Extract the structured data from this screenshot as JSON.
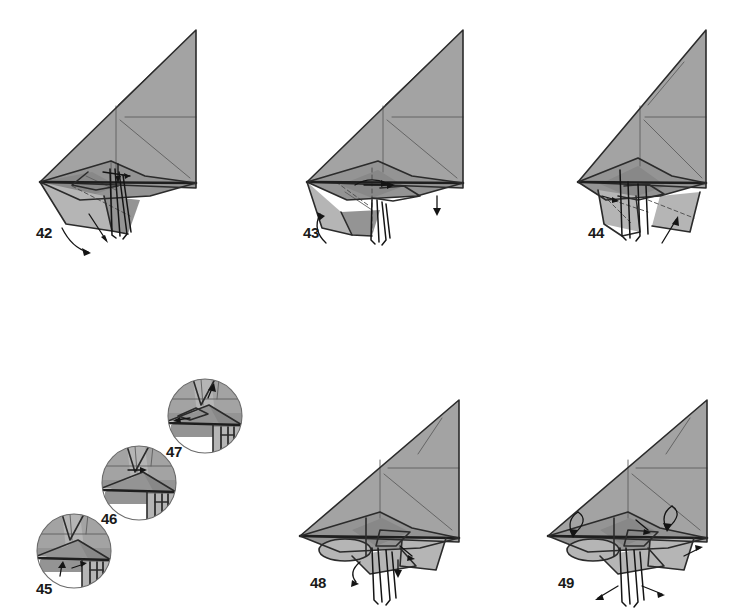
{
  "page": {
    "width": 747,
    "height": 613,
    "background_color": "#ffffff",
    "paper_fill_color": "#a3a3a3",
    "paper_shade_color": "#949494",
    "paper_light_color": "#b5b5b5",
    "line_color": "#2b2b2b",
    "crease_color": "#5e5e5e",
    "label_color": "#1a1a1a"
  },
  "rows": [
    {
      "name": "top-row",
      "steps": [
        "42",
        "43",
        "44"
      ]
    },
    {
      "name": "bottom-row",
      "steps": [
        "45",
        "46",
        "47",
        "48",
        "49"
      ]
    }
  ],
  "steps": [
    {
      "number": "42",
      "kind": "main",
      "label_x": 36,
      "label_y": 238,
      "origin_x": 20,
      "origin_y": 10,
      "scale": 1.0,
      "arrows": [
        "curved-unfold-down-left",
        "straight-fold-down"
      ],
      "notes": "large wing triangle with body and two legs, swing flap down"
    },
    {
      "number": "43",
      "kind": "main",
      "label_x": 303,
      "label_y": 238,
      "origin_x": 287,
      "origin_y": 10,
      "scale": 1.0,
      "arrows": [
        "curved-roll-left",
        "rotate-arrow-center",
        "small-down-arrow-right"
      ],
      "notes": "body narrowed, valley fold dashed line through centre"
    },
    {
      "number": "44",
      "kind": "main",
      "label_x": 588,
      "label_y": 238,
      "origin_x": 572,
      "origin_y": 10,
      "scale": 1.0,
      "arrows": [
        "small-up-arrow-lower-right"
      ],
      "notes": "legs spread, rear flap folded, dashed hidden creases"
    },
    {
      "number": "45",
      "kind": "inset",
      "label_x": 36,
      "label_y": 594,
      "center_x": 74,
      "center_y": 551,
      "radius": 37,
      "arrows": [
        "small-pull-arrow-left",
        "small-point-arrow"
      ],
      "notes": "close-up of body joint, pleat detail"
    },
    {
      "number": "46",
      "kind": "inset",
      "label_x": 101,
      "label_y": 524,
      "center_x": 139,
      "center_y": 483,
      "radius": 37,
      "arrows": [
        "small-point-arrow-right"
      ],
      "notes": "close-up after pleat, narrowing neck"
    },
    {
      "number": "47",
      "kind": "inset",
      "label_x": 166,
      "label_y": 457,
      "center_x": 205,
      "center_y": 416,
      "radius": 37,
      "arrows": [
        "small-arrow-left",
        "small-arrow-up"
      ],
      "notes": "close-up of finished head/neck shaping"
    },
    {
      "number": "48",
      "kind": "main",
      "label_x": 310,
      "label_y": 588,
      "origin_x": 294,
      "origin_y": 380,
      "scale": 0.93,
      "arrows": [
        "curl-arrow-under-body",
        "small-arrow-right"
      ],
      "notes": "wings open, head formed, rounded body underneath"
    },
    {
      "number": "49",
      "kind": "main",
      "label_x": 558,
      "label_y": 588,
      "origin_x": 542,
      "origin_y": 380,
      "scale": 0.93,
      "arrows": [
        "roll-wing-left",
        "roll-wing-right",
        "pull-legs-out",
        "small-arrow-tail"
      ],
      "notes": "final shaping, curl both wings and spread the four legs"
    }
  ],
  "icons": {
    "valley_fold": "dashed-line-icon",
    "mountain_fold": "dash-dot-line-icon",
    "fold_arrow": "solid-arrow-icon",
    "rotate_arrow": "curved-arrow-icon",
    "inset_circle": "magnifier-circle-icon"
  }
}
